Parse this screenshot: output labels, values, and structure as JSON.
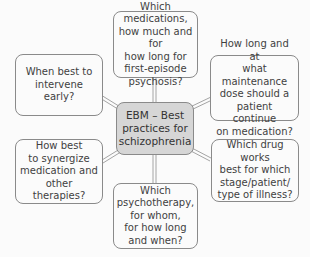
{
  "diagram": {
    "type": "mind-map",
    "center": {
      "lines": [
        "EBM – Best",
        "practices for",
        "schizophrenia"
      ],
      "fill": "#d6d6d6"
    },
    "nodes": [
      {
        "id": "top",
        "lines": [
          "Which medications,",
          "how much and for",
          "how long for",
          "first-episode",
          "psychosis?"
        ]
      },
      {
        "id": "upper-left",
        "lines": [
          "When best to",
          "intervene early?"
        ]
      },
      {
        "id": "upper-right",
        "lines": [
          "How long and at",
          "what maintenance",
          "dose should a",
          "patient continue",
          "on medication?"
        ]
      },
      {
        "id": "lower-left",
        "lines": [
          "How best",
          "to synergize",
          "medication and",
          "other therapies?"
        ]
      },
      {
        "id": "lower-right",
        "lines": [
          "Which drug works",
          "best for which",
          "stage/patient/",
          "type of illness?"
        ]
      },
      {
        "id": "bottom",
        "lines": [
          "Which",
          "psychotherapy,",
          "for whom,",
          "for how long",
          "and when?"
        ]
      }
    ],
    "colors": {
      "background": "#fbfbfb",
      "border": "#8a8a8a",
      "connector": "#9a9a9a",
      "text": "#3f3f3f"
    }
  }
}
